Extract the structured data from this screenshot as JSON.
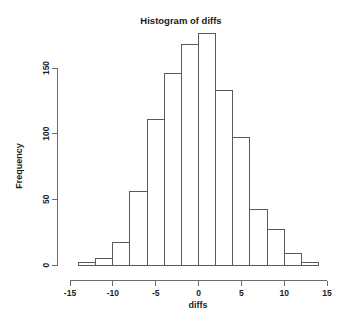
{
  "chart_data": {
    "type": "bar",
    "subtype": "histogram",
    "title": "Histogram of diffs",
    "xlabel": "diffs",
    "ylabel": "Frequency",
    "bin_width": 2,
    "bin_edges": [
      -14,
      -12,
      -10,
      -8,
      -6,
      -4,
      -2,
      0,
      2,
      4,
      6,
      8,
      10,
      12,
      14
    ],
    "categories": [
      "-14 to -12",
      "-12 to -10",
      "-10 to -8",
      "-8 to -6",
      "-6 to -4",
      "-4 to -2",
      "-2 to 0",
      "0 to 2",
      "2 to 4",
      "4 to 6",
      "6 to 8",
      "8 to 10",
      "10 to 12",
      "12 to 14"
    ],
    "bin_centers": [
      -13,
      -11,
      -9,
      -7,
      -5,
      -3,
      -1,
      1,
      3,
      5,
      7,
      9,
      11,
      13
    ],
    "values": [
      2,
      5,
      17,
      56,
      111,
      146,
      168,
      176,
      133,
      97,
      42,
      27,
      9,
      2
    ],
    "xlim": [
      -15,
      15
    ],
    "ylim": [
      0,
      180
    ],
    "x_ticks": [
      -15,
      -10,
      -5,
      0,
      5,
      10,
      15
    ],
    "x_tick_labels": [
      "-15",
      "-10",
      "-5",
      "0",
      "5",
      "10",
      "15"
    ],
    "y_ticks": [
      0,
      50,
      100,
      150
    ],
    "y_tick_labels": [
      "0",
      "50",
      "100",
      "150"
    ],
    "grid": false,
    "legend": false,
    "bar_fill_color": "#ffffff",
    "bar_border_color": "#5a5a5a",
    "axis_color": "#6b6b6b",
    "text_color": "#1a1a1a",
    "background_color": "#ffffff"
  }
}
